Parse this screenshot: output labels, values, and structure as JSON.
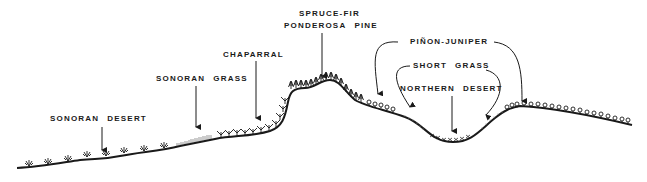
{
  "diagram": {
    "type": "vegetation-profile",
    "colors": {
      "ink": "#1a1a1a",
      "background": "#ffffff"
    },
    "labels": {
      "sonoran_desert": {
        "word1": "SONORAN",
        "word2": "DESERT"
      },
      "sonoran_grass": {
        "word1": "SONORAN",
        "word2": "GRASS"
      },
      "chaparral": "CHAPARRAL",
      "spruce_fir": "SPRUCE-FIR",
      "ponderosa_pine": {
        "word1": "PONDEROSA",
        "word2": "PINE"
      },
      "pinon_juniper": "PIÑON-JUNIPER",
      "short_grass": {
        "word1": "SHORT",
        "word2": "GRASS"
      },
      "northern_desert": {
        "word1": "NORTHERN",
        "word2": "DESERT"
      }
    },
    "vegetation_zones": [
      "Sonoran Desert",
      "Sonoran Grass",
      "Chaparral",
      "Spruce-Fir / Ponderosa Pine",
      "Piñon-Juniper",
      "Short Grass",
      "Northern Desert"
    ]
  }
}
